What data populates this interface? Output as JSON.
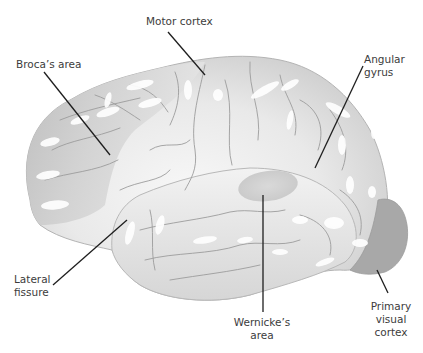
{
  "diagram": {
    "type": "labeled-anatomy-illustration",
    "top_caption_cut_off": "",
    "colors": {
      "background": "#ffffff",
      "frontal_lobe": "#c8c8c8",
      "cortex_light": "#e4e4e4",
      "temporal_lobe": "#dcdcdc",
      "wernicke_area": "#cfcfcf",
      "occipital_visual": "#a9a9a9",
      "sulci_lines": "#9c9c9c",
      "highlights": "#ffffff",
      "leader_lines": "#1e1e1e",
      "label_text": "#3c3c3c"
    },
    "labels": {
      "motor": "Motor cortex",
      "broca": "Broca’s area",
      "angular_line1": "Angular",
      "angular_line2": "gyrus",
      "lateral_line1": "Lateral",
      "lateral_line2": "fissure",
      "wernicke_line1": "Wernicke’s",
      "wernicke_line2": "area",
      "visual_line1": "Primary",
      "visual_line2": "visual",
      "visual_line3": "cortex"
    }
  }
}
